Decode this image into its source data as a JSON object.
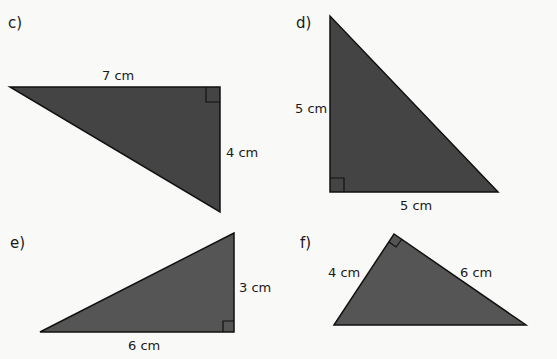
{
  "colors": {
    "fill_dark": "#444444",
    "fill_medium": "#555555",
    "background": "#f9f9f7"
  },
  "triangles": [
    {
      "part": "c)",
      "base_label": "7 cm",
      "height_label": "4 cm",
      "right_angle": true
    },
    {
      "part": "d)",
      "base_label": "5 cm",
      "height_label": "5 cm",
      "right_angle": true
    },
    {
      "part": "e)",
      "base_label": "6 cm",
      "height_label": "3 cm",
      "right_angle": true
    },
    {
      "part": "f)",
      "base_label": "4 cm",
      "height_label": "6 cm",
      "right_angle": true
    }
  ]
}
